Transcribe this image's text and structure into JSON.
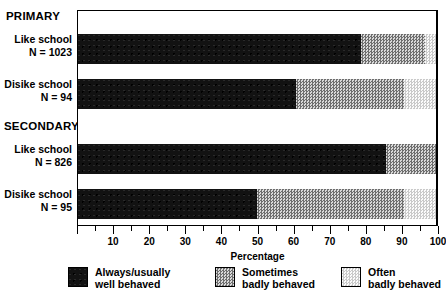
{
  "chart_data": {
    "type": "bar",
    "orientation": "horizontal",
    "stacked": true,
    "title": "",
    "xlabel": "Percentage",
    "ylabel": "",
    "xlim": [
      0,
      100
    ],
    "xticks": [
      0,
      10,
      20,
      30,
      40,
      50,
      60,
      70,
      80,
      90,
      100
    ],
    "xtick_labels": [
      "",
      "10",
      "20",
      "30",
      "40",
      "50",
      "60",
      "70",
      "80",
      "90",
      "100"
    ],
    "minor_tick_step": 5,
    "grid": false,
    "legend_position": "bottom",
    "groups": [
      {
        "name": "PRIMARY",
        "rows": [
          {
            "label_line1": "Like school",
            "label_line2": "N = 1023",
            "n": 1023,
            "values": [
              79,
              18,
              3
            ]
          },
          {
            "label_line1": "Disike school",
            "label_line2": "N = 94",
            "n": 94,
            "values": [
              61,
              30,
              9
            ]
          }
        ]
      },
      {
        "name": "SECONDARY",
        "rows": [
          {
            "label_line1": "Like school",
            "label_line2": "N = 826",
            "n": 826,
            "values": [
              86,
              14,
              0
            ]
          },
          {
            "label_line1": "Disike school",
            "label_line2": "N = 95",
            "n": 95,
            "values": [
              50,
              41,
              9
            ]
          }
        ]
      }
    ],
    "series": [
      {
        "name": "Always/usually well behaved",
        "name_line1": "Always/usually",
        "name_line2": "well behaved",
        "fill": "black-solid",
        "color": "#121212",
        "values": [
          79,
          61,
          86,
          50
        ]
      },
      {
        "name": "Sometimes badly behaved",
        "name_line1": "Sometimes",
        "name_line2": "badly behaved",
        "fill": "medium-checker",
        "color": "#9a9a9a",
        "values": [
          18,
          30,
          14,
          41
        ]
      },
      {
        "name": "Often badly behaved",
        "name_line1": "Often",
        "name_line2": "badly behaved",
        "fill": "light-checker",
        "color": "#e4e4e4",
        "values": [
          3,
          9,
          0,
          9
        ]
      }
    ],
    "categories": [
      "PRIMARY / Like school (N = 1023)",
      "PRIMARY / Disike school (N = 94)",
      "SECONDARY / Like school (N = 826)",
      "SECONDARY / Disike school (N = 95)"
    ]
  },
  "axis": {
    "title": "Percentage"
  },
  "legend": {
    "items": [
      {
        "line1": "Always/usually",
        "line2": "well behaved",
        "fill": "black-solid"
      },
      {
        "line1": "Sometimes",
        "line2": "badly behaved",
        "fill": "medium-checker"
      },
      {
        "line1": "Often",
        "line2": "badly behaved",
        "fill": "light-checker"
      }
    ]
  },
  "labels": {
    "group_primary": "PRIMARY",
    "group_secondary": "SECONDARY",
    "row0_l1": "Like school",
    "row0_l2": "N = 1023",
    "row1_l1": "Disike school",
    "row1_l2": "N = 94",
    "row2_l1": "Like school",
    "row2_l2": "N = 826",
    "row3_l1": "Disike school",
    "row3_l2": "N = 95"
  }
}
